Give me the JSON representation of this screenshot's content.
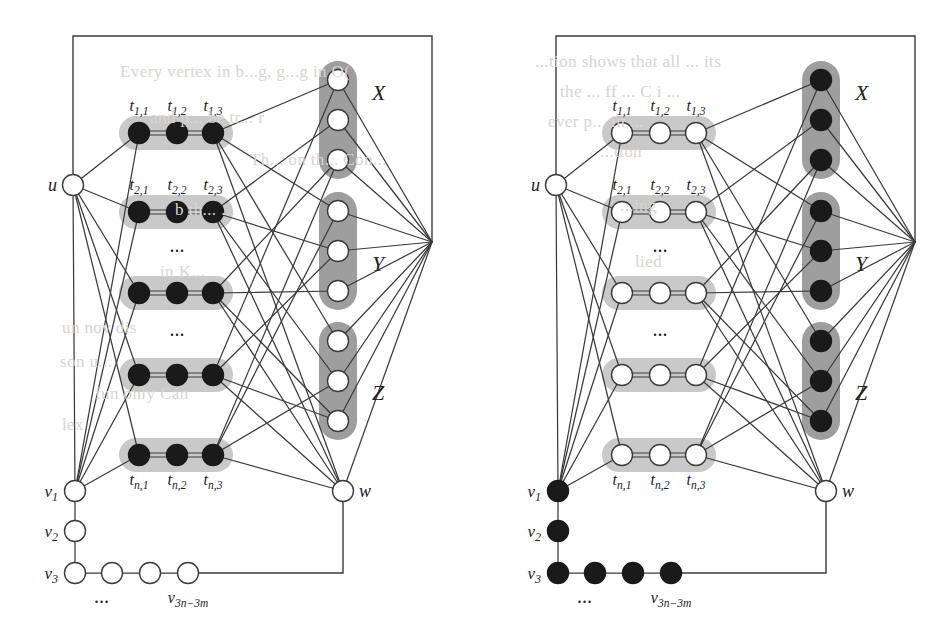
{
  "figure": {
    "type": "graph-diagram",
    "panels": [
      {
        "id": "left",
        "vertex_style": {
          "triangles": "black",
          "sets": "white",
          "path": "white",
          "u": "white",
          "w": "white"
        }
      },
      {
        "id": "right",
        "vertex_style": {
          "triangles": "white",
          "sets": "black",
          "path": "black",
          "u": "white",
          "w": "white"
        }
      }
    ],
    "triangle_rows": [
      {
        "labels": [
          "t",
          "t",
          "t"
        ],
        "sub": [
          "1,1",
          "1,2",
          "1,3"
        ],
        "show_labels": true
      },
      {
        "labels": [
          "t",
          "t",
          "t"
        ],
        "sub": [
          "2,1",
          "2,2",
          "2,3"
        ],
        "show_labels": true
      },
      {
        "labels": [
          "",
          "",
          ""
        ],
        "sub": [
          "",
          "",
          ""
        ],
        "show_labels": false
      },
      {
        "labels": [
          "",
          "",
          ""
        ],
        "sub": [
          "",
          "",
          ""
        ],
        "show_labels": false
      },
      {
        "labels": [
          "t",
          "t",
          "t"
        ],
        "sub": [
          "n,1",
          "n,2",
          "n,3"
        ],
        "show_labels": true
      }
    ],
    "row_labels": {
      "row1": [
        "t₁,₁",
        "t₁,₂",
        "t₁,₃"
      ],
      "row2": [
        "t₂,₁",
        "t₂,₂",
        "t₂,₃"
      ],
      "rown": [
        "tₙ,₁",
        "tₙ,₂",
        "tₙ,₃"
      ]
    },
    "set_groups": [
      {
        "name": "X",
        "label": "X",
        "count": 3
      },
      {
        "name": "Y",
        "label": "Y",
        "count": 3
      },
      {
        "name": "Z",
        "label": "Z",
        "count": 3
      }
    ],
    "special_vertices": [
      {
        "name": "u",
        "label": "u"
      },
      {
        "name": "w",
        "label": "w"
      },
      {
        "name": "v1",
        "label": "v",
        "sub": "1"
      },
      {
        "name": "v2",
        "label": "v",
        "sub": "2"
      },
      {
        "name": "v3",
        "label": "v",
        "sub": "3"
      },
      {
        "name": "v3n3m",
        "label": "v",
        "sub": "3n−3m"
      }
    ],
    "ellipses": [
      "...",
      "...",
      "..."
    ],
    "bottom_path_label": "v",
    "bottom_path_sub": "3n−3m",
    "bottom_ellipsis": "...",
    "colors": {
      "ink": "#3b3b3b",
      "node_fill_white": "#ffffff",
      "node_fill_black": "#1a1a1a",
      "group_light": "#c9c9c9",
      "group_dark": "#9e9e9e",
      "paper": "#ffffff"
    }
  },
  "background_text": {
    "items": [
      {
        "text": "Every vertex in b...g, g...g in  O(",
        "x": 120,
        "y": 62
      },
      {
        "text": "and  p...  be  tr...  r",
        "x": 150,
        "y": 108
      },
      {
        "text": "Th... on th... Con...",
        "x": 250,
        "y": 150
      },
      {
        "text": "b th... ...",
        "x": 175,
        "y": 200
      },
      {
        "text": "in K...",
        "x": 160,
        "y": 262
      },
      {
        "text": "un nov dis",
        "x": 62,
        "y": 318
      },
      {
        "text": "son u...",
        "x": 60,
        "y": 352
      },
      {
        "text": "fun   only Can",
        "x": 95,
        "y": 384
      },
      {
        "text": "lex",
        "x": 62,
        "y": 415
      },
      {
        "text": "...tion shows that all ... its",
        "x": 535,
        "y": 52
      },
      {
        "text": "the ... ff ...  C i ...",
        "x": 560,
        "y": 82
      },
      {
        "text": "ever  p...  in  ...",
        "x": 548,
        "y": 112
      },
      {
        "text": "...tion",
        "x": 600,
        "y": 142
      },
      {
        "text": "...ing",
        "x": 620,
        "y": 196
      },
      {
        "text": "lied",
        "x": 635,
        "y": 252
      }
    ]
  }
}
